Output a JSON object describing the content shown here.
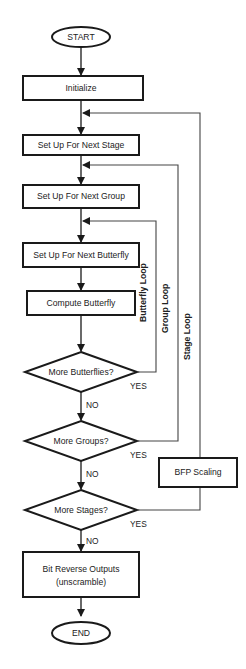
{
  "flowchart": {
    "start": "START",
    "end": "END",
    "steps": {
      "initialize": "Initialize",
      "setup_stage": "Set Up  For Next Stage",
      "setup_group": "Set Up For Next Group",
      "setup_butterfly": "Set Up For Next Butterfly",
      "compute_butterfly": "Compute Butterfly",
      "bfp_scaling": "BFP Scaling",
      "bit_reverse_line1": "Bit Reverse Outputs",
      "bit_reverse_line2": "(unscramble)"
    },
    "decisions": {
      "more_butterflies": "More Butterflies?",
      "more_groups": "More Groups?",
      "more_stages": "More Stages?"
    },
    "branch_labels": {
      "yes": "YES",
      "no": "NO"
    },
    "loops": {
      "butterfly": "Butterfly Loop",
      "group": "Group Loop",
      "stage": "Stage Loop"
    },
    "colors": {
      "stroke": "#1a1a1a",
      "loop_line": "#555555",
      "background": "#ffffff"
    }
  }
}
